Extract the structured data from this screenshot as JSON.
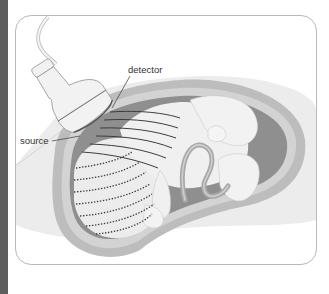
{
  "figure": {
    "labels": {
      "detector": "detector",
      "source": "source"
    },
    "colors": {
      "background": "#ffffff",
      "left_strip": "#5e5e5e",
      "frame_border": "#b9b9b9",
      "abdomen_outer": "#e6e6e6",
      "uterine_wall": "#bdbdbd",
      "amniotic_cavity": "#8f8f8f",
      "fetus": "#eeeeee",
      "umbilical_cord": "#a9a9a9",
      "probe": "#f2f2f2",
      "wave_lines": "#3d3d3d"
    }
  }
}
